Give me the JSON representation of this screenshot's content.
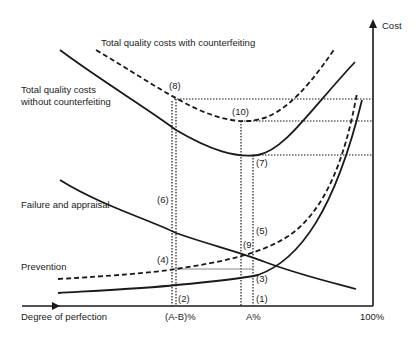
{
  "diagram": {
    "axes": {
      "x_label": "Degree of perfection",
      "y_label": "Cost",
      "x_ticks": [
        "(A-B)%",
        "A%",
        "100%"
      ]
    },
    "curve_labels": {
      "total_with": "Total quality costs with counterfeiting",
      "total_without_line1": "Total quality costs",
      "total_without_line2": "without counterfeiting",
      "failure": "Failure and appraisal",
      "prevention": "Prevention"
    },
    "points": {
      "p1": "(1)",
      "p2": "(2)",
      "p3": "(3)",
      "p4": "(4)",
      "p5": "(5)",
      "p6": "(6)",
      "p7": "(7)",
      "p8": "(8)",
      "p9": "(9",
      "p10": "(10)"
    },
    "colors": {
      "line": "#1a1a1a",
      "background": "#ffffff"
    }
  }
}
